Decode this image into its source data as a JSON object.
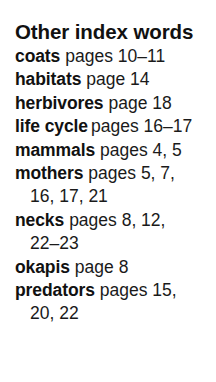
{
  "title": "Other index words",
  "entries": [
    {
      "term": "coats",
      "pages": "pages 10–11",
      "continuation": ""
    },
    {
      "term": "habitats",
      "pages": "page 14",
      "continuation": ""
    },
    {
      "term": "herbivores",
      "pages": "page 18",
      "continuation": ""
    },
    {
      "term": "life cycle",
      "pages": "pages 16–17",
      "continuation": ""
    },
    {
      "term": "mammals",
      "pages": "pages 4, 5",
      "continuation": ""
    },
    {
      "term": "mothers",
      "pages": "pages 5, 7,",
      "continuation": "16, 17, 21"
    },
    {
      "term": "necks",
      "pages": "pages 8, 12,",
      "continuation": "22–23"
    },
    {
      "term": "okapis",
      "pages": "page 8",
      "continuation": ""
    },
    {
      "term": "predators",
      "pages": "pages 15,",
      "continuation": "20, 22"
    }
  ]
}
